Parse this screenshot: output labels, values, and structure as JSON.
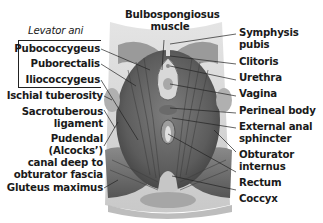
{
  "diagram": {
    "group_label": "Levator ani",
    "left_labels": [
      {
        "id": "pubococcygeus",
        "text": "Pubococcygeus"
      },
      {
        "id": "puborectalis",
        "text": "Puborectalis"
      },
      {
        "id": "iliococcygeus",
        "text": "Iliococcygeus"
      },
      {
        "id": "ischial-tuberosity",
        "text": "Ischial tuberosity"
      },
      {
        "id": "sacrotuberous-ligament",
        "line1": "Sacrotuberous",
        "line2": "ligament"
      },
      {
        "id": "pudendal-canal",
        "line1": "Pudendal",
        "line2": "(Alcocks’)",
        "line3": "canal deep to",
        "line4": "obturator fascia"
      },
      {
        "id": "gluteus-maximus",
        "text": "Gluteus maximus"
      }
    ],
    "top_label": {
      "line1": "Bulbospongiosus",
      "line2": "muscle"
    },
    "right_labels": [
      {
        "id": "symphysis-pubis",
        "line1": "Symphysis",
        "line2": "pubis"
      },
      {
        "id": "clitoris",
        "text": "Clitoris"
      },
      {
        "id": "urethra",
        "text": "Urethra"
      },
      {
        "id": "vagina",
        "text": "Vagina"
      },
      {
        "id": "perineal-body",
        "text": "Perineal body"
      },
      {
        "id": "external-anal-sphincter",
        "line1": "External anal",
        "line2": "sphincter"
      },
      {
        "id": "obturator-internus",
        "line1": "Obturator",
        "line2": "internus"
      },
      {
        "id": "rectum",
        "text": "Rectum"
      },
      {
        "id": "coccyx",
        "text": "Coccyx"
      }
    ],
    "colors": {
      "muscle_dark": "#5a5a5a",
      "muscle_mid": "#8a8a8a",
      "muscle_light": "#c4c4c4",
      "background_shape": "#d6d6d6",
      "label_text": "#1a1a1a"
    }
  }
}
